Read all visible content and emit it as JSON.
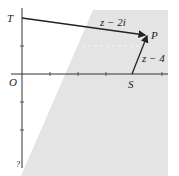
{
  "diagram": {
    "type": "argand-diagram",
    "origin_label": "O",
    "points": {
      "T": {
        "label": "T",
        "coords": [
          0,
          2
        ]
      },
      "S": {
        "label": "S",
        "coords": [
          4,
          0
        ]
      },
      "P": {
        "label": "P",
        "coords": [
          4.5,
          1.5
        ]
      }
    },
    "vectors": [
      {
        "from": "T",
        "to": "P",
        "label": "z − 2i"
      },
      {
        "from": "S",
        "to": "P",
        "label": "z − 4"
      }
    ],
    "region": {
      "description": "shaded half-plane to the right of the perpendicular bisector of TS",
      "color": "#e4e4e4"
    },
    "axis_color": "#333333",
    "bottom_label": "?"
  }
}
